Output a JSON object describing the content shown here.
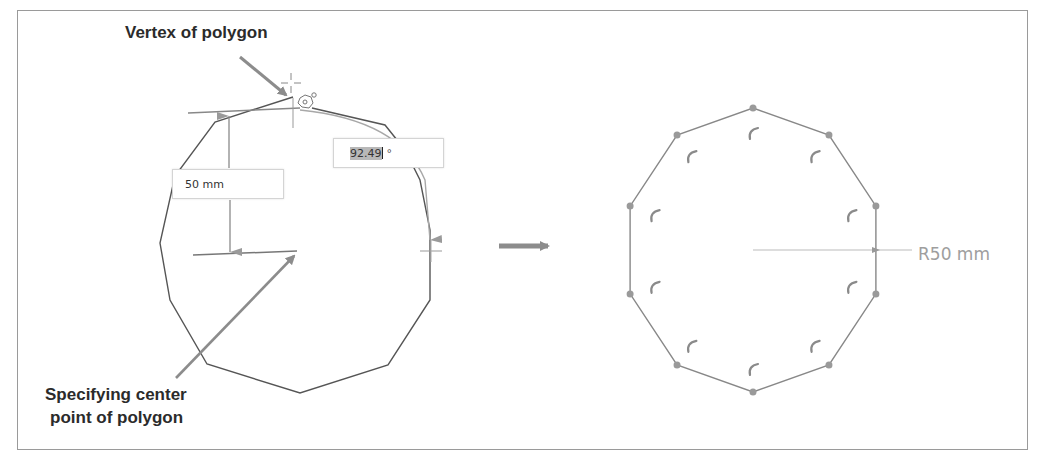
{
  "callouts": {
    "vertex": "Vertex of polygon",
    "center_line1": "Specifying center",
    "center_line2": "point of polygon"
  },
  "inputs": {
    "length_value": "50 mm",
    "angle_value": "92.49",
    "angle_unit": "°"
  },
  "result": {
    "radius_label": "R50 mm",
    "sides": 10
  },
  "colors": {
    "polygon_line": "#555555",
    "guide": "#8a8a8a",
    "vertex_point": "#9a9a9a",
    "arrow": "#8c8c8c",
    "label_gray": "#9e9e9e"
  }
}
